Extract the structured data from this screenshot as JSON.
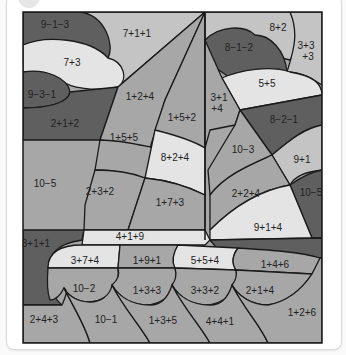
{
  "worksheet": {
    "title": "Color-by-number sailboat",
    "colors": {
      "darkest": "#5f5f5f",
      "dark": "#7d7d7d",
      "medium": "#a7a7a7",
      "light": "#c4c4c4",
      "lightest": "#e4e4e4",
      "outline": "#1a1a1a"
    },
    "regions": [
      {
        "id": "cloud1-top",
        "label": "9−1−3"
      },
      {
        "id": "sky-top",
        "label": "7+1+1"
      },
      {
        "id": "cloud1-mid",
        "label": "7+3"
      },
      {
        "id": "cloud1-bottom",
        "label": "9−3−1"
      },
      {
        "id": "sky-left",
        "label": "2+1+2"
      },
      {
        "id": "sail-left-1",
        "label": "1+2+4"
      },
      {
        "id": "sail-left-2",
        "label": "1+5+2"
      },
      {
        "id": "sail-left-3",
        "label": "1+5+5"
      },
      {
        "id": "sail-left-4",
        "label": "8+2+4"
      },
      {
        "id": "sea-left",
        "label": "10−5"
      },
      {
        "id": "sail-left-5",
        "label": "2+3+2"
      },
      {
        "id": "sail-left-6",
        "label": "1+7+3"
      },
      {
        "id": "cloud2-top-right",
        "label": "8+2"
      },
      {
        "id": "cloud2-top-left",
        "label": "8−1−2"
      },
      {
        "id": "sky-right-corner",
        "label": "3+3\n+3"
      },
      {
        "id": "cloud2-mid",
        "label": "5+5"
      },
      {
        "id": "sail-right-top",
        "label": "3+1\n+4"
      },
      {
        "id": "sky-right",
        "label": "8−2−1"
      },
      {
        "id": "sail-right-1",
        "label": "10−3"
      },
      {
        "id": "sky-right-2",
        "label": "9+1"
      },
      {
        "id": "sail-right-2",
        "label": "2+2+4"
      },
      {
        "id": "sea-right",
        "label": "10−5"
      },
      {
        "id": "sail-right-3",
        "label": "9+1+4"
      },
      {
        "id": "sea-left-2",
        "label": "3+1+1"
      },
      {
        "id": "boom",
        "label": "4+1+9"
      },
      {
        "id": "hull-1",
        "label": "3+7+4"
      },
      {
        "id": "hull-2",
        "label": "1+9+1"
      },
      {
        "id": "hull-3",
        "label": "5+5+4"
      },
      {
        "id": "hull-4",
        "label": "1+4+6"
      },
      {
        "id": "wave-1",
        "label": "10−2"
      },
      {
        "id": "wave-2",
        "label": "1+3+3"
      },
      {
        "id": "wave-3",
        "label": "3+3+2"
      },
      {
        "id": "wave-4",
        "label": "2+1+4"
      },
      {
        "id": "water-1",
        "label": "2+4+3"
      },
      {
        "id": "water-2",
        "label": "10−1"
      },
      {
        "id": "water-3",
        "label": "1+3+5"
      },
      {
        "id": "water-4",
        "label": "4+4+1"
      },
      {
        "id": "water-5",
        "label": "1+2+6"
      }
    ]
  }
}
